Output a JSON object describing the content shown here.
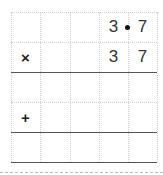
{
  "worksheet": {
    "type": "long-multiplication-grid",
    "columns": 5,
    "rows": 5,
    "row1": {
      "digits": [
        "",
        "",
        "",
        "3",
        "7"
      ],
      "decimal_point_after_col": 4
    },
    "row2": {
      "operator": "×",
      "digits": [
        "",
        "",
        "",
        "3",
        "7"
      ]
    },
    "row3": {
      "digits": [
        "",
        "",
        "",
        "",
        ""
      ]
    },
    "row4": {
      "operator": "+",
      "digits": [
        "",
        "",
        "",
        "",
        ""
      ]
    },
    "row5": {
      "digits": [
        "",
        "",
        "",
        "",
        ""
      ]
    }
  }
}
